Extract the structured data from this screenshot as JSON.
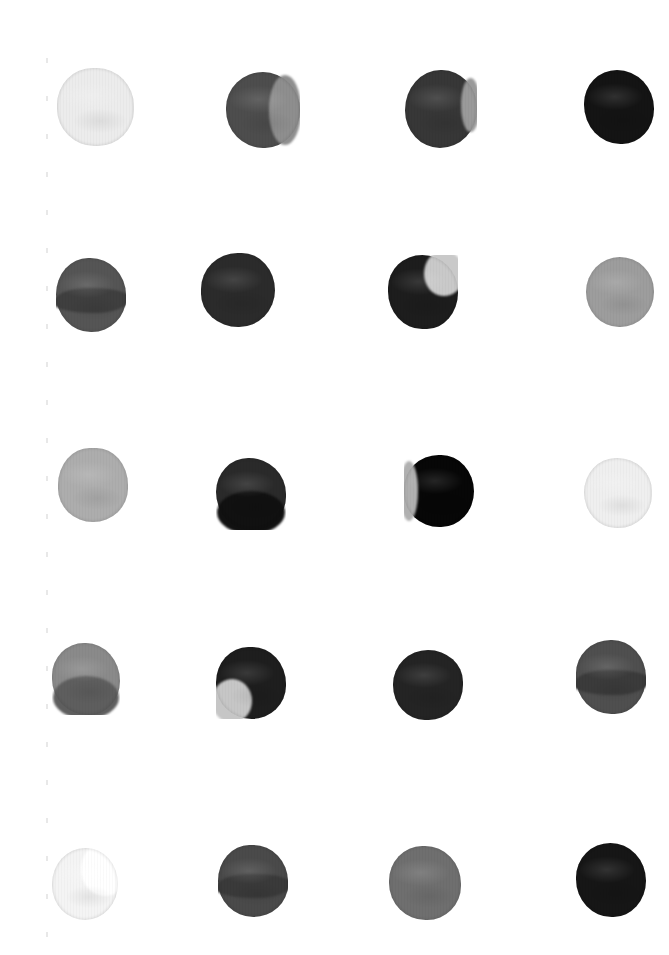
{
  "document": {
    "title": "Grayscale Ink Dot Grid",
    "background_color": "#ffffff",
    "width": 669,
    "height": 955,
    "rows": 5,
    "columns": 4,
    "margin_ticks": {
      "color": "#e8e8e8",
      "x": 46,
      "count": 25,
      "spacing": 38,
      "start_y": 58
    }
  },
  "chart_data": {
    "type": "heatmap",
    "xlabel": "",
    "ylabel": "",
    "rows": 5,
    "columns": 4,
    "cell_size": 76,
    "col_centers": [
      95,
      262,
      440,
      620
    ],
    "row_centers": [
      108,
      293,
      483,
      677,
      884
    ],
    "values": [
      [
        0.08,
        0.72,
        0.82,
        0.95
      ],
      [
        0.6,
        0.86,
        0.88,
        0.42
      ],
      [
        0.38,
        0.84,
        0.97,
        0.1
      ],
      [
        0.5,
        0.88,
        0.86,
        0.62
      ],
      [
        0.05,
        0.7,
        0.46,
        0.91
      ]
    ],
    "cells": [
      {
        "row": 0,
        "col": 0,
        "name": "dot-r1c1",
        "x": 57,
        "y": 68,
        "w": 77,
        "h": 78,
        "fill": "#ececec",
        "overlay": null,
        "overlay_rect": null,
        "tone": "very-light"
      },
      {
        "row": 0,
        "col": 1,
        "name": "dot-r1c2",
        "x": 226,
        "y": 72,
        "w": 74,
        "h": 76,
        "fill": "#4d4d4d",
        "overlay": "#8e8e8e",
        "overlay_rect": "right",
        "tone": "medium-dark"
      },
      {
        "row": 0,
        "col": 2,
        "name": "dot-r1c3",
        "x": 405,
        "y": 70,
        "w": 72,
        "h": 78,
        "fill": "#373737",
        "overlay": "#9a9a9a",
        "overlay_rect": "right-sliver",
        "tone": "dark"
      },
      {
        "row": 0,
        "col": 3,
        "name": "dot-r1c4",
        "x": 584,
        "y": 70,
        "w": 70,
        "h": 74,
        "fill": "#141414",
        "overlay": null,
        "overlay_rect": null,
        "tone": "near-black"
      },
      {
        "row": 1,
        "col": 0,
        "name": "dot-r2c1",
        "x": 56,
        "y": 258,
        "w": 70,
        "h": 74,
        "fill": "#555555",
        "overlay": "#3f3f3f",
        "overlay_rect": "band-mid",
        "tone": "medium"
      },
      {
        "row": 1,
        "col": 1,
        "name": "dot-r2c2",
        "x": 201,
        "y": 253,
        "w": 74,
        "h": 74,
        "fill": "#2b2b2b",
        "overlay": null,
        "overlay_rect": null,
        "tone": "very-dark"
      },
      {
        "row": 1,
        "col": 2,
        "name": "dot-r2c3",
        "x": 388,
        "y": 255,
        "w": 70,
        "h": 74,
        "fill": "#1d1d1d",
        "overlay": "#c9c9c9",
        "overlay_rect": "top-right",
        "tone": "near-black"
      },
      {
        "row": 1,
        "col": 3,
        "name": "dot-r2c4",
        "x": 586,
        "y": 257,
        "w": 68,
        "h": 70,
        "fill": "#9d9d9d",
        "overlay": null,
        "overlay_rect": null,
        "tone": "light-gray"
      },
      {
        "row": 2,
        "col": 0,
        "name": "dot-r3c1",
        "x": 58,
        "y": 448,
        "w": 70,
        "h": 74,
        "fill": "#adadad",
        "overlay": null,
        "overlay_rect": null,
        "tone": "light"
      },
      {
        "row": 2,
        "col": 1,
        "name": "dot-r3c2",
        "x": 216,
        "y": 458,
        "w": 70,
        "h": 72,
        "fill": "#2a2a2a",
        "overlay": "#111111",
        "overlay_rect": "bottom",
        "tone": "very-dark"
      },
      {
        "row": 2,
        "col": 2,
        "name": "dot-r3c3",
        "x": 404,
        "y": 455,
        "w": 70,
        "h": 72,
        "fill": "#070707",
        "overlay": "#b0b0b0",
        "overlay_rect": "left-sliver",
        "tone": "black"
      },
      {
        "row": 2,
        "col": 3,
        "name": "dot-r3c4",
        "x": 584,
        "y": 458,
        "w": 68,
        "h": 70,
        "fill": "#efefef",
        "overlay": null,
        "overlay_rect": null,
        "tone": "very-light"
      },
      {
        "row": 3,
        "col": 0,
        "name": "dot-r4c1",
        "x": 52,
        "y": 643,
        "w": 68,
        "h": 72,
        "fill": "#8a8a8a",
        "overlay": "#5e5e5e",
        "overlay_rect": "bottom",
        "tone": "medium-light"
      },
      {
        "row": 3,
        "col": 1,
        "name": "dot-r4c2",
        "x": 216,
        "y": 647,
        "w": 70,
        "h": 72,
        "fill": "#1e1e1e",
        "overlay": "#c6c6c6",
        "overlay_rect": "bottom-left",
        "tone": "near-black"
      },
      {
        "row": 3,
        "col": 2,
        "name": "dot-r4c3",
        "x": 393,
        "y": 650,
        "w": 70,
        "h": 70,
        "fill": "#242424",
        "overlay": null,
        "overlay_rect": null,
        "tone": "very-dark"
      },
      {
        "row": 3,
        "col": 3,
        "name": "dot-r4c4",
        "x": 576,
        "y": 640,
        "w": 70,
        "h": 74,
        "fill": "#4f4f4f",
        "overlay": "#3b3b3b",
        "overlay_rect": "band-mid",
        "tone": "medium"
      },
      {
        "row": 4,
        "col": 0,
        "name": "dot-r5c1",
        "x": 52,
        "y": 848,
        "w": 66,
        "h": 72,
        "fill": "#f4f4f4",
        "overlay": "#ffffff",
        "overlay_rect": "crescent-right",
        "tone": "near-white"
      },
      {
        "row": 4,
        "col": 1,
        "name": "dot-r5c2",
        "x": 218,
        "y": 845,
        "w": 70,
        "h": 72,
        "fill": "#4a4a4a",
        "overlay": "#3a3a3a",
        "overlay_rect": "band-mid",
        "tone": "medium-dark"
      },
      {
        "row": 4,
        "col": 2,
        "name": "dot-r5c3",
        "x": 389,
        "y": 846,
        "w": 72,
        "h": 74,
        "fill": "#6f6f6f",
        "overlay": null,
        "overlay_rect": null,
        "tone": "medium-gray"
      },
      {
        "row": 4,
        "col": 3,
        "name": "dot-r5c4",
        "x": 576,
        "y": 843,
        "w": 70,
        "h": 74,
        "fill": "#161616",
        "overlay": null,
        "overlay_rect": null,
        "tone": "near-black"
      }
    ]
  }
}
